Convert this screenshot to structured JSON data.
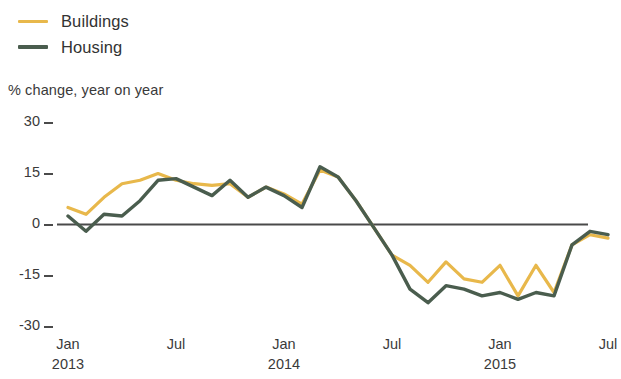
{
  "legend": {
    "items": [
      {
        "label": "Buildings",
        "color": "#E8B84B",
        "key": "buildings"
      },
      {
        "label": "Housing",
        "color": "#4A5D4E",
        "key": "housing"
      }
    ]
  },
  "subtitle": "% change, year on year",
  "axis": {
    "y_ticks": [
      "30",
      "15",
      "0",
      "-15",
      "-30"
    ],
    "x_ticks": [
      {
        "month": "Jan",
        "year": "2013"
      },
      {
        "month": "Jul",
        "year": ""
      },
      {
        "month": "Jan",
        "year": "2014"
      },
      {
        "month": "Jul",
        "year": ""
      },
      {
        "month": "Jan",
        "year": "2015"
      },
      {
        "month": "Jul",
        "year": ""
      }
    ]
  },
  "chart_data": {
    "type": "line",
    "title": "",
    "subtitle": "% change, year on year",
    "xlabel": "",
    "ylabel": "% change, year on year",
    "ylim": [
      -30,
      30
    ],
    "yticks": [
      -30,
      -15,
      0,
      15,
      30
    ],
    "grid": false,
    "zero_line": true,
    "legend_position": "top-left",
    "x": [
      "Jan 2013",
      "Feb 2013",
      "Mar 2013",
      "Apr 2013",
      "May 2013",
      "Jun 2013",
      "Jul 2013",
      "Aug 2013",
      "Sep 2013",
      "Oct 2013",
      "Nov 2013",
      "Dec 2013",
      "Jan 2014",
      "Feb 2014",
      "Mar 2014",
      "Apr 2014",
      "May 2014",
      "Jun 2014",
      "Jul 2014",
      "Aug 2014",
      "Sep 2014",
      "Oct 2014",
      "Nov 2014",
      "Dec 2014",
      "Jan 2015",
      "Feb 2015",
      "Mar 2015",
      "Apr 2015",
      "May 2015",
      "Jun 2015",
      "Jul 2015"
    ],
    "xticklabels": [
      "Jan 2013",
      "Jul",
      "Jan 2014",
      "Jul",
      "Jan 2015",
      "Jul"
    ],
    "series": [
      {
        "name": "Buildings",
        "color": "#E8B84B",
        "values": [
          5,
          3,
          8,
          12,
          13,
          15,
          13,
          12,
          11.5,
          12,
          8,
          11,
          9,
          6,
          16,
          14,
          7,
          -1,
          -9,
          -12,
          -17,
          -11,
          -16,
          -17,
          -12,
          -21,
          -12,
          -20,
          -6,
          -3,
          -4
        ]
      },
      {
        "name": "Housing",
        "color": "#4A5D4E",
        "values": [
          2.5,
          -2,
          3,
          2.5,
          7,
          13,
          13.5,
          11,
          8.5,
          13,
          8,
          11,
          8.5,
          5,
          17,
          14,
          7,
          -1,
          -9,
          -19,
          -23,
          -18,
          -19,
          -21,
          -20,
          -22,
          -20,
          -21,
          -6,
          -2,
          -3
        ]
      }
    ]
  }
}
